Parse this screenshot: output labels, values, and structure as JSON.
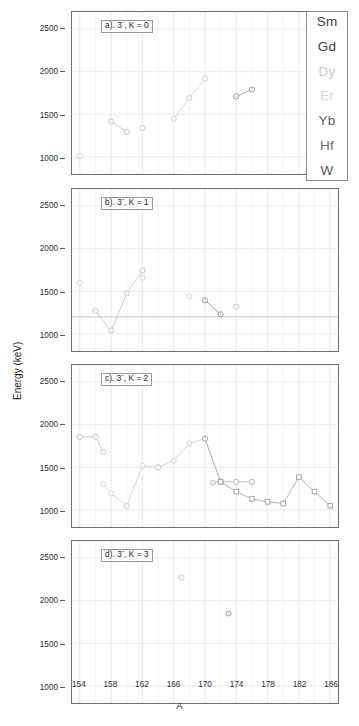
{
  "figure": {
    "xlabel": "A",
    "ylabel": "Energy (keV)",
    "xticks": [
      "154",
      "158",
      "162",
      "166",
      "170",
      "174",
      "178",
      "182",
      "186"
    ],
    "yticks": [
      "2500",
      "2000",
      "1500",
      "1000"
    ],
    "xlim": [
      153,
      187
    ],
    "ylim": [
      800,
      2700
    ]
  },
  "legend": {
    "items": [
      {
        "label": "Sm",
        "color": "#3c3c3c"
      },
      {
        "label": "Gd",
        "color": "#3f3f3f"
      },
      {
        "label": "Dy",
        "color": "#c8c8c8"
      },
      {
        "label": "Er",
        "color": "#d8d8d8"
      },
      {
        "label": "Yb",
        "color": "#5a5a5a"
      },
      {
        "label": "Hf",
        "color": "#6b6b6b"
      },
      {
        "label": "W",
        "color": "#555555"
      }
    ]
  },
  "panels": [
    {
      "id": "a",
      "label": "a). 3⁻, K = 0"
    },
    {
      "id": "b",
      "label": "b). 3⁻, K = 1"
    },
    {
      "id": "c",
      "label": "c). 3⁻, K = 2"
    },
    {
      "id": "d",
      "label": "d). 3⁻, K = 3"
    }
  ],
  "chart_data": [
    {
      "type": "scatter",
      "panel": "a",
      "title": "a). 3- , K = 0",
      "xlabel": "A",
      "ylabel": "Energy (keV)",
      "xlim": [
        153,
        187
      ],
      "ylim": [
        800,
        2700
      ],
      "grid": true,
      "series": [
        {
          "name": "Sm",
          "color": "#c9c9c9",
          "marker": "circle",
          "line": false,
          "x": [
            154
          ],
          "y": [
            1010
          ]
        },
        {
          "name": "Gd",
          "color": "#b9b9b9",
          "marker": "circle",
          "line": true,
          "x": [
            158,
            160
          ],
          "y": [
            1415,
            1295
          ]
        },
        {
          "name": "Dy",
          "color": "#c4c4c4",
          "marker": "circle",
          "line": false,
          "x": [
            162
          ],
          "y": [
            1340
          ]
        },
        {
          "name": "Er",
          "color": "#c9c9c9",
          "marker": "circle",
          "line": true,
          "x": [
            166,
            168,
            170
          ],
          "y": [
            1445,
            1690,
            1920
          ]
        },
        {
          "name": "Yb",
          "color": "#8f8f8f",
          "marker": "circle",
          "line": true,
          "x": [
            174,
            176
          ],
          "y": [
            1710,
            1790
          ]
        }
      ]
    },
    {
      "type": "scatter",
      "panel": "b",
      "title": "b). 3- , K = 1",
      "xlabel": "A",
      "ylabel": "Energy (keV)",
      "xlim": [
        153,
        187
      ],
      "ylim": [
        800,
        2700
      ],
      "grid": true,
      "series": [
        {
          "name": "Sm",
          "color": "#c9c9c9",
          "marker": "circle",
          "line": false,
          "x": [
            154
          ],
          "y": [
            1600
          ]
        },
        {
          "name": "Gd",
          "color": "#bdbdbd",
          "marker": "circle",
          "line": true,
          "x": [
            156,
            158,
            160,
            162
          ],
          "y": [
            1270,
            1040,
            1475,
            1745
          ]
        },
        {
          "name": "Dy",
          "color": "#cfcfcf",
          "marker": "circle",
          "line": false,
          "x": [
            162
          ],
          "y": [
            1660
          ]
        },
        {
          "name": "Er",
          "color": "#c9c9c9",
          "marker": "circle",
          "line": false,
          "x": [
            168
          ],
          "y": [
            1440
          ]
        },
        {
          "name": "Yb",
          "color": "#8a8a8a",
          "marker": "circle",
          "line": true,
          "x": [
            170,
            172
          ],
          "y": [
            1395,
            1230
          ]
        },
        {
          "name": "Hf",
          "color": "#b5b5b5",
          "marker": "circle",
          "line": false,
          "x": [
            174
          ],
          "y": [
            1320
          ]
        }
      ]
    },
    {
      "type": "scatter",
      "panel": "c",
      "title": "c). 3- , K = 2",
      "xlabel": "A",
      "ylabel": "Energy (keV)",
      "xlim": [
        153,
        187
      ],
      "ylim": [
        800,
        2700
      ],
      "grid": true,
      "series": [
        {
          "name": "Sm",
          "color": "#c4c4c4",
          "marker": "circle",
          "line": true,
          "x": [
            154,
            156,
            157
          ],
          "y": [
            1855,
            1860,
            1680
          ]
        },
        {
          "name": "Gd",
          "color": "#cecece",
          "marker": "circle",
          "line": true,
          "x": [
            157,
            158,
            160
          ],
          "y": [
            1300,
            1195,
            1045
          ]
        },
        {
          "name": "Dy",
          "color": "#cdcdcd",
          "marker": "circle",
          "line": true,
          "x": [
            160,
            162,
            164
          ],
          "y": [
            1045,
            1520,
            1500
          ]
        },
        {
          "name": "Er",
          "color": "#c7c7c7",
          "marker": "circle",
          "line": true,
          "x": [
            164,
            166,
            168,
            170
          ],
          "y": [
            1500,
            1580,
            1780,
            1835
          ]
        },
        {
          "name": "Yb",
          "color": "#9a9a9a",
          "marker": "circle",
          "line": true,
          "x": [
            170,
            172
          ],
          "y": [
            1835,
            1330
          ]
        },
        {
          "name": "Hf",
          "color": "#b0b0b0",
          "marker": "circle",
          "line": true,
          "x": [
            171,
            172,
            174,
            176
          ],
          "y": [
            1320,
            1330,
            1330,
            1330
          ]
        },
        {
          "name": "W",
          "color": "#9d9d9d",
          "marker": "square",
          "line": true,
          "x": [
            172,
            174,
            176,
            178,
            180,
            182,
            184,
            186
          ],
          "y": [
            1330,
            1215,
            1130,
            1095,
            1075,
            1385,
            1215,
            1050
          ]
        }
      ]
    },
    {
      "type": "scatter",
      "panel": "d",
      "title": "d). 3- , K = 3",
      "xlabel": "A",
      "ylabel": "Energy (keV)",
      "xlim": [
        153,
        187
      ],
      "ylim": [
        800,
        2700
      ],
      "grid": true,
      "series": [
        {
          "name": "Er",
          "color": "#c9c9c9",
          "marker": "circle",
          "line": false,
          "x": [
            167
          ],
          "y": [
            2270
          ]
        },
        {
          "name": "Yb",
          "color": "#8f8f8f",
          "marker": "circle",
          "line": false,
          "x": [
            173
          ],
          "y": [
            1850
          ]
        }
      ]
    }
  ]
}
